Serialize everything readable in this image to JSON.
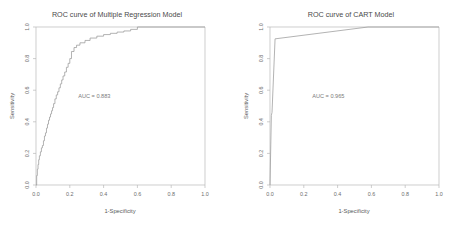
{
  "figure": {
    "background_color": "#ffffff",
    "width": 468,
    "height": 234,
    "panel_count": 2
  },
  "chart_data": [
    {
      "type": "line",
      "title": "ROC curve of Multiple Regression Model",
      "xlabel": "1-Specificity",
      "ylabel": "Sensitivity",
      "xlim": [
        0.0,
        1.0
      ],
      "ylim": [
        0.0,
        1.0
      ],
      "grid": false,
      "legend": null,
      "annotations": [
        {
          "text": "AUC = 0.883",
          "x": 0.25,
          "y": 0.55
        }
      ],
      "xticks": [
        "0.0",
        "0.2",
        "0.4",
        "0.6",
        "0.8",
        "1.0"
      ],
      "xtick_values": [
        0.0,
        0.2,
        0.4,
        0.6,
        0.8,
        1.0
      ],
      "yticks": [
        "0.0",
        "0.2",
        "0.4",
        "0.6",
        "0.8",
        "1.0"
      ],
      "ytick_values": [
        0.0,
        0.2,
        0.4,
        0.6,
        0.8,
        1.0
      ],
      "series": [
        {
          "name": "Multiple Regression ROC",
          "auc": 0.883,
          "line_color": "#9a9a9a",
          "x": [
            0.0,
            0.004,
            0.004,
            0.008,
            0.008,
            0.012,
            0.012,
            0.016,
            0.016,
            0.02,
            0.02,
            0.026,
            0.026,
            0.032,
            0.032,
            0.038,
            0.038,
            0.044,
            0.044,
            0.05,
            0.05,
            0.056,
            0.056,
            0.062,
            0.062,
            0.068,
            0.068,
            0.074,
            0.074,
            0.08,
            0.08,
            0.086,
            0.086,
            0.092,
            0.092,
            0.098,
            0.098,
            0.104,
            0.104,
            0.112,
            0.112,
            0.12,
            0.12,
            0.128,
            0.128,
            0.136,
            0.136,
            0.144,
            0.144,
            0.152,
            0.152,
            0.16,
            0.16,
            0.17,
            0.17,
            0.18,
            0.18,
            0.19,
            0.19,
            0.2,
            0.2,
            0.21,
            0.21,
            0.225,
            0.225,
            0.24,
            0.24,
            0.26,
            0.26,
            0.29,
            0.29,
            0.32,
            0.32,
            0.36,
            0.36,
            0.4,
            0.4,
            0.44,
            0.44,
            0.48,
            0.48,
            0.52,
            0.52,
            0.56,
            0.56,
            0.6,
            0.6,
            1.0
          ],
          "y": [
            0.0,
            0.0,
            0.06,
            0.06,
            0.1,
            0.1,
            0.13,
            0.13,
            0.16,
            0.16,
            0.185,
            0.185,
            0.21,
            0.21,
            0.235,
            0.235,
            0.25,
            0.25,
            0.28,
            0.28,
            0.31,
            0.31,
            0.33,
            0.33,
            0.36,
            0.36,
            0.385,
            0.385,
            0.41,
            0.41,
            0.43,
            0.43,
            0.45,
            0.45,
            0.47,
            0.47,
            0.49,
            0.49,
            0.515,
            0.515,
            0.545,
            0.545,
            0.57,
            0.57,
            0.59,
            0.59,
            0.615,
            0.615,
            0.64,
            0.64,
            0.665,
            0.665,
            0.69,
            0.69,
            0.715,
            0.715,
            0.745,
            0.745,
            0.77,
            0.77,
            0.8,
            0.8,
            0.845,
            0.845,
            0.87,
            0.87,
            0.885,
            0.885,
            0.9,
            0.9,
            0.915,
            0.915,
            0.93,
            0.93,
            0.942,
            0.942,
            0.952,
            0.952,
            0.96,
            0.96,
            0.968,
            0.968,
            0.975,
            0.975,
            0.985,
            0.985,
            1.0,
            1.0,
            1.0
          ]
        }
      ]
    },
    {
      "type": "line",
      "title": "ROC curve of CART Model",
      "xlabel": "1-Specificity",
      "ylabel": "Sensitivity",
      "xlim": [
        0.0,
        1.0
      ],
      "ylim": [
        0.0,
        1.0
      ],
      "grid": false,
      "legend": null,
      "annotations": [
        {
          "text": "AUC = 0.965",
          "x": 0.25,
          "y": 0.55
        }
      ],
      "xticks": [
        "0.0",
        "0.2",
        "0.4",
        "0.6",
        "0.8",
        "1.0"
      ],
      "xtick_values": [
        0.0,
        0.2,
        0.4,
        0.6,
        0.8,
        1.0
      ],
      "yticks": [
        "0.0",
        "0.2",
        "0.4",
        "0.6",
        "0.8",
        "1.0"
      ],
      "ytick_values": [
        0.0,
        0.2,
        0.4,
        0.6,
        0.8,
        1.0
      ],
      "series": [
        {
          "name": "CART ROC",
          "auc": 0.965,
          "line_color": "#9a9a9a",
          "x": [
            0.0,
            0.008,
            0.012,
            0.03,
            0.58,
            1.0
          ],
          "y": [
            0.0,
            0.44,
            0.46,
            0.925,
            1.0,
            1.0
          ]
        }
      ]
    }
  ]
}
